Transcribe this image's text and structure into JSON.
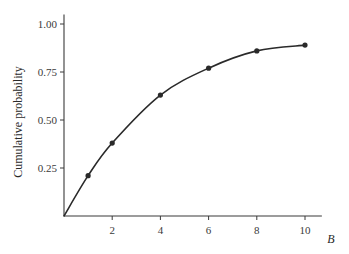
{
  "chart_data": {
    "type": "line",
    "title": "",
    "xlabel": "B",
    "ylabel": "Cumulative probability",
    "xlim": [
      0,
      10.7
    ],
    "ylim": [
      0,
      1.05
    ],
    "x_ticks": [
      2,
      4,
      6,
      8,
      10
    ],
    "x_tick_labels": [
      "2",
      "4",
      "6",
      "8",
      "10"
    ],
    "y_ticks": [
      0.25,
      0.5,
      0.75,
      1.0
    ],
    "y_tick_labels": [
      "0.25",
      "0.50",
      "0.75",
      "1.00"
    ],
    "grid": false,
    "legend": null,
    "series": [
      {
        "name": "Cumulative probability",
        "curve": "smooth",
        "markers": true,
        "x": [
          1,
          2,
          4,
          6,
          8,
          10
        ],
        "values": [
          0.21,
          0.38,
          0.63,
          0.77,
          0.86,
          0.89
        ],
        "curve_start": [
          0,
          0
        ]
      }
    ],
    "colors": {
      "line": "#2a2a2a",
      "axis": "#3a3a3a",
      "marker": "#2a2a2a"
    }
  }
}
